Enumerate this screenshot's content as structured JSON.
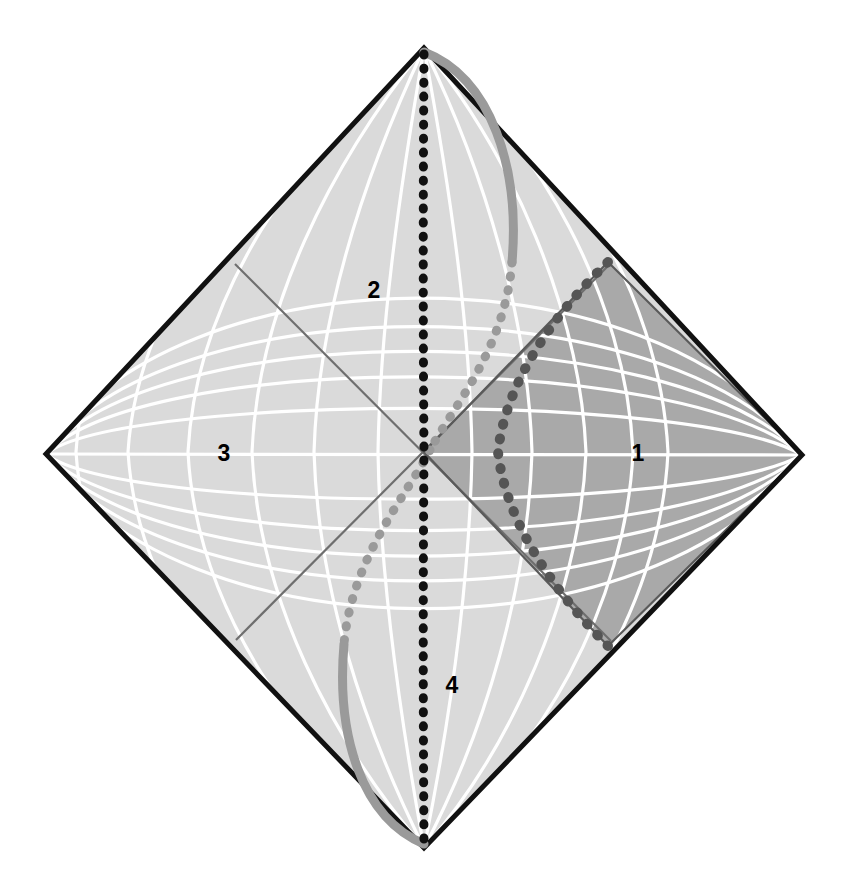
{
  "figure": {
    "kind": "penrose-conformal-diagram",
    "title_visible": false,
    "background_color": "#ffffff",
    "width": 848,
    "height": 884
  },
  "diamond": {
    "top_vertex": {
      "x": 424,
      "y": 48
    },
    "right_vertex": {
      "x": 802,
      "y": 455
    },
    "bottom_vertex": {
      "x": 424,
      "y": 848
    },
    "left_vertex": {
      "x": 46,
      "y": 454
    },
    "center": {
      "x": 424,
      "y": 452
    },
    "boundary_color": "#111111",
    "boundary_width": 5
  },
  "regions": [
    {
      "id": "1",
      "label": "1",
      "name": "region-one-right-exterior",
      "x": 638,
      "y": 453,
      "fill": "#a9a9a9"
    },
    {
      "id": "2",
      "label": "2",
      "name": "region-two-upper",
      "x": 374,
      "y": 290,
      "fill": "#d9d9d9"
    },
    {
      "id": "3",
      "label": "3",
      "name": "region-three-left-exterior",
      "x": 224,
      "y": 453,
      "fill": "#dcdcdc"
    },
    {
      "id": "4",
      "label": "4",
      "name": "region-four-lower",
      "x": 452,
      "y": 685,
      "fill": "#d9d9d9"
    }
  ],
  "inner_diamond": {
    "name": "shaded-inner-wedge",
    "top": {
      "x": 608,
      "y": 262
    },
    "bottom": {
      "x": 608,
      "y": 646
    },
    "left": {
      "x": 424,
      "y": 452
    },
    "right": {
      "x": 802,
      "y": 455
    },
    "edge_color": "#5a5a5a",
    "edge_width": 2
  },
  "horizons": {
    "name": "horizon-diagonals",
    "color": "#6e6e6e",
    "width": 2,
    "lines": [
      {
        "from": {
          "x": 235,
          "y": 264
        },
        "to": {
          "x": 611,
          "y": 641
        }
      },
      {
        "from": {
          "x": 611,
          "y": 263
        },
        "to": {
          "x": 236,
          "y": 640
        }
      }
    ]
  },
  "grid": {
    "name": "conformal-coordinate-grid",
    "color": "#ffffff",
    "width": 3.2,
    "u_lines": 11,
    "v_lines": 11
  },
  "curves": [
    {
      "name": "vertical-dotted-worldline",
      "style": "dotted",
      "color": "#111111",
      "dot_radius": 4.6,
      "dot_spacing": 13,
      "description": "near-vertical dotted line through the center from top vertex to bottom vertex"
    },
    {
      "name": "light-gray-s-curve",
      "style": "dotted-to-solid",
      "color": "#9a9a9a",
      "dot_radius": 5.0,
      "dot_spacing": 13,
      "description": "S-shaped curve bowing right in the upper half and left in the lower half, solid gray near the top-right and bottom-left boundaries"
    },
    {
      "name": "dark-gray-bowed-curve",
      "style": "dotted",
      "color": "#5a5a5a",
      "dot_radius": 5.2,
      "dot_spacing": 14,
      "description": "dark dotted curve bulging rightwards inside region 1, meeting the outer boundary at the upper-right and lower-right"
    }
  ],
  "colors": {
    "outer_boundary": "#111111",
    "light_fill": "#d9d9d9",
    "dark_fill": "#a9a9a9",
    "grid_line": "#ffffff",
    "horizon_line": "#6e6e6e",
    "label_text": "#000000",
    "curve_black": "#111111",
    "curve_light_gray": "#9a9a9a",
    "curve_dark_gray": "#555555"
  }
}
